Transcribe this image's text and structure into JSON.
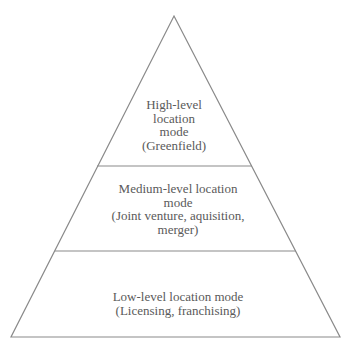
{
  "diagram": {
    "type": "pyramid",
    "line_color": "#8a8a8a",
    "text_color": "#5a5a5a",
    "tiers": [
      {
        "id": "high",
        "lines": [
          "High-level",
          "location",
          "mode",
          "(Greenfield)"
        ]
      },
      {
        "id": "medium",
        "lines": [
          "Medium-level location",
          "mode",
          "(Joint venture, aquisition,",
          "merger)"
        ]
      },
      {
        "id": "low",
        "lines": [
          "Low-level location mode",
          "(Licensing, franchising)"
        ]
      }
    ]
  }
}
